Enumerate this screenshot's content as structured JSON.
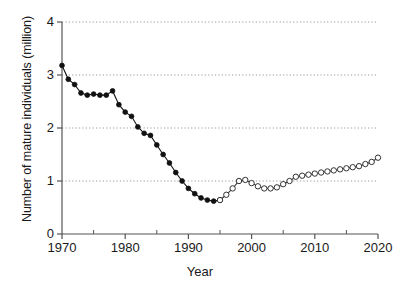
{
  "chart_data": {
    "type": "line",
    "title": "",
    "xlabel": "Year",
    "ylabel": "Number of mature individuals (million)",
    "xlim": [
      1970,
      2020
    ],
    "ylim": [
      0,
      4
    ],
    "xticks": [
      1970,
      1980,
      1990,
      2000,
      2010,
      2020
    ],
    "xtick_labels": [
      "1970",
      "1980",
      "1990",
      "2000",
      "2010",
      "2020"
    ],
    "xminorticks": [
      1975,
      1985,
      1995,
      2005,
      2015
    ],
    "yticks": [
      0,
      1,
      2,
      3,
      4
    ],
    "ytick_labels": [
      "0",
      "1",
      "2",
      "3",
      "4"
    ],
    "grid": "horizontal-dotted",
    "legend": "none",
    "series": [
      {
        "name": "observed",
        "marker": "filled-circle",
        "x": [
          1970,
          1971,
          1972,
          1973,
          1974,
          1975,
          1976,
          1977,
          1978,
          1979,
          1980,
          1981,
          1982,
          1983,
          1984,
          1985,
          1986,
          1987,
          1988,
          1989,
          1990,
          1991,
          1992,
          1993,
          1994,
          1995
        ],
        "values": [
          3.18,
          2.92,
          2.82,
          2.66,
          2.62,
          2.64,
          2.62,
          2.62,
          2.7,
          2.44,
          2.3,
          2.22,
          2.02,
          1.9,
          1.86,
          1.68,
          1.5,
          1.34,
          1.16,
          1.0,
          0.86,
          0.76,
          0.68,
          0.64,
          0.62,
          0.64
        ]
      },
      {
        "name": "projected",
        "marker": "open-circle",
        "x": [
          1995,
          1996,
          1997,
          1998,
          1999,
          2000,
          2001,
          2002,
          2003,
          2004,
          2005,
          2006,
          2007,
          2008,
          2009,
          2010,
          2011,
          2012,
          2013,
          2014,
          2015,
          2016,
          2017,
          2018,
          2019,
          2020
        ],
        "values": [
          0.64,
          0.74,
          0.86,
          1.0,
          1.02,
          0.96,
          0.9,
          0.86,
          0.86,
          0.88,
          0.94,
          1.0,
          1.08,
          1.1,
          1.12,
          1.14,
          1.16,
          1.18,
          1.2,
          1.22,
          1.24,
          1.26,
          1.28,
          1.32,
          1.36,
          1.44
        ]
      }
    ]
  },
  "colors": {
    "axis": "#555555",
    "grid": "#999999",
    "observed": "#111111",
    "projected": "#333333",
    "text": "#1a1a1a",
    "background": "#ffffff"
  }
}
